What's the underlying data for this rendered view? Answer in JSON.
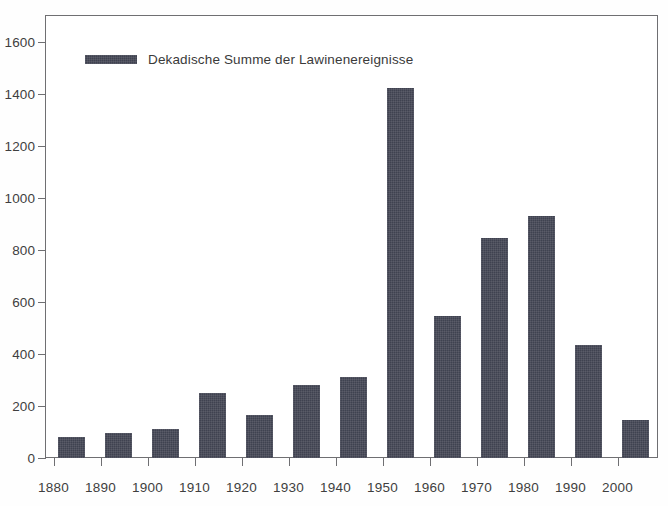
{
  "chart_data": {
    "type": "bar",
    "title": "",
    "xlabel": "",
    "ylabel": "",
    "categories": [
      "1880",
      "1890",
      "1900",
      "1910",
      "1920",
      "1930",
      "1940",
      "1950",
      "1960",
      "1970",
      "1980",
      "1990",
      "2000"
    ],
    "values": [
      80,
      95,
      110,
      250,
      165,
      280,
      312,
      1425,
      545,
      845,
      930,
      435,
      145
    ],
    "series": [
      {
        "name": "Dekadische Summe der Lawinenereignisse",
        "values": [
          80,
          95,
          110,
          250,
          165,
          280,
          312,
          1425,
          545,
          845,
          930,
          435,
          145
        ]
      }
    ],
    "ylim": [
      0,
      1700
    ],
    "yticks": [
      0,
      200,
      400,
      600,
      800,
      1000,
      1200,
      1400,
      1600
    ],
    "ytick_labels": [
      "0",
      "200",
      "400",
      "600",
      "800",
      "1000",
      "1200",
      "1400",
      "1600"
    ],
    "xticks": [
      "1880",
      "1890",
      "1900",
      "1910",
      "1920",
      "1930",
      "1940",
      "1950",
      "1960",
      "1970",
      "1980",
      "1990",
      "2000"
    ],
    "grid": false,
    "legend": {
      "position": "top-left-inside",
      "entries": [
        {
          "label": "Dekadische Summe der Lawinenereignisse",
          "color": "#3f4250",
          "swatch": "legend-swatch"
        }
      ]
    },
    "colors": {
      "bar": "#3f4250",
      "axis": "#6f6f72",
      "text": "#3a3a3a",
      "background": "#ffffff"
    }
  }
}
